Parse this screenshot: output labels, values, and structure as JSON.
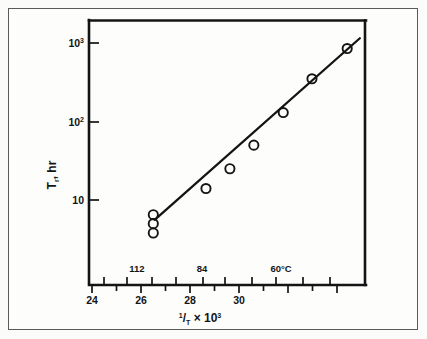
{
  "figure": {
    "background_color": "#fdfdfc",
    "ink_color": "#141414",
    "border_color": "#5a5a5a"
  },
  "axis": {
    "y_title_main": "T",
    "y_title_sub": "r",
    "y_title_rest": ", hr",
    "y_title_full": "T r, hr",
    "x_title_numerator": "1",
    "x_title_denominator": "T",
    "x_title_times": "×",
    "x_title_base": "10",
    "x_title_exp": "3",
    "x_title_full": "1/T × 10³",
    "y_tick_labels": [
      "10",
      "10²",
      "10³"
    ],
    "x_tick_labels": [
      "24",
      "26",
      "28",
      "30"
    ],
    "secondary_tick_labels": [
      "112",
      "84",
      "60°C"
    ]
  },
  "chart_data": {
    "type": "scatter",
    "title": "",
    "xlabel": "1/T × 10³",
    "ylabel": "T_r, hr",
    "yscale": "log",
    "xscale": "linear",
    "xlim": [
      23.5,
      31.6
    ],
    "ylim": [
      2.8,
      2000
    ],
    "grid": false,
    "legend": null,
    "x_ticks": [
      24,
      26,
      28,
      30
    ],
    "x_minor_ticks": [
      24.5,
      25,
      25.5,
      26.5,
      27,
      27.5,
      28.5,
      29,
      29.5,
      30.5,
      31
    ],
    "y_ticks": [
      10,
      100,
      1000
    ],
    "y_tick_text": [
      "10",
      "10²",
      "10³"
    ],
    "secondary_axis": {
      "name": "temperature",
      "unit": "°C",
      "ticks": [
        {
          "label": "112",
          "x": 25.95
        },
        {
          "label": "84",
          "x": 28.0
        },
        {
          "label": "60°C",
          "x": 30.0
        }
      ],
      "minor_tick_x": [
        24.5,
        25.45,
        26.45,
        27.4,
        28.5,
        29.4,
        30.5,
        31.4
      ]
    },
    "points": [
      {
        "x": 25.38,
        "y": 6.5
      },
      {
        "x": 25.38,
        "y": 5.0
      },
      {
        "x": 25.38,
        "y": 3.8
      },
      {
        "x": 26.92,
        "y": 14.0
      },
      {
        "x": 27.62,
        "y": 25.0
      },
      {
        "x": 28.32,
        "y": 50.0
      },
      {
        "x": 29.18,
        "y": 130.0
      },
      {
        "x": 30.02,
        "y": 350.0
      },
      {
        "x": 31.05,
        "y": 850.0
      }
    ],
    "fit_line": {
      "x_start": 25.42,
      "y_start": 5.6,
      "x_end": 31.42,
      "y_end": 1150.0
    }
  }
}
